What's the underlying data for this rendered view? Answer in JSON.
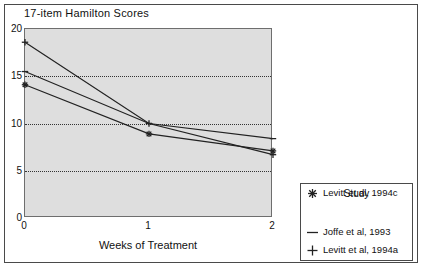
{
  "chart_data": {
    "type": "line",
    "title": "17-item Hamilton Scores",
    "xlabel": "Weeks of Treatment",
    "ylabel": "",
    "x": [
      0,
      1,
      2
    ],
    "xticks": [
      "0",
      "1",
      "2"
    ],
    "yticks": [
      "0",
      "5",
      "10",
      "15",
      "20"
    ],
    "xlim": [
      0,
      2
    ],
    "ylim": [
      0,
      20
    ],
    "grid": "horizontal-dotted",
    "legend_position": "outside-right-bottom",
    "legend_title": "Study",
    "series": [
      {
        "name": "Joffe et al, 1993",
        "marker": "dash",
        "values": [
          15.5,
          10.0,
          8.4
        ]
      },
      {
        "name": "Levitt et al, 1994a",
        "marker": "plus",
        "values": [
          18.6,
          10.0,
          6.7
        ]
      },
      {
        "name": "Levitt et al, 1994c",
        "marker": "asterisk",
        "values": [
          14.1,
          8.9,
          7.1
        ]
      }
    ]
  },
  "colors": {
    "plot_background": "#dedede",
    "line": "#222222",
    "grid": "#333333",
    "frame": "#4a4a4a",
    "text": "#111111"
  },
  "icons": {
    "joffe_marker": "dash-marker-icon",
    "levitt_a_marker": "plus-marker-icon",
    "levitt_c_marker": "asterisk-marker-icon"
  }
}
